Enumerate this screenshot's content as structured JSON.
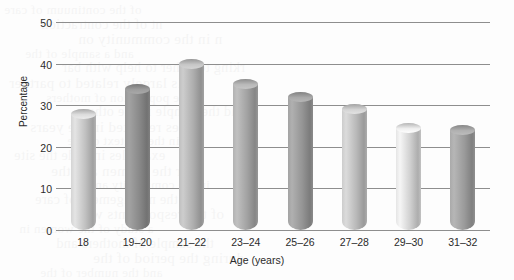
{
  "chart_data": {
    "type": "bar",
    "title": "",
    "subtitle": "",
    "xlabel": "Age (years)",
    "ylabel": "Percentage",
    "categories": [
      "18",
      "19–20",
      "21–22",
      "23–24",
      "25–26",
      "27–28",
      "29–30",
      "31–32"
    ],
    "values": [
      28,
      34,
      40,
      35,
      32,
      29,
      24.5,
      24
    ],
    "series": [
      {
        "name": "Percentage",
        "values": [
          28,
          34,
          40,
          35,
          32,
          29,
          24.5,
          24
        ]
      }
    ],
    "ylim": [
      0,
      50
    ],
    "yticks": [
      0,
      10,
      20,
      30,
      40,
      50
    ],
    "ytick_labels": [
      "0",
      "10",
      "20",
      "30",
      "40",
      "50"
    ],
    "grid": true,
    "grid_axis": "y",
    "legend": false,
    "legend_position": "none",
    "bar_style": "3d-cylinder",
    "bar_colors": [
      "#c8c8c8",
      "#8f8f8f",
      "#b4b4b4",
      "#a8a8a8",
      "#9a9a9a",
      "#c0c0c0",
      "#d8d8d8",
      "#a0a0a0"
    ],
    "annotations": []
  },
  "axes": {
    "y_axis_title": "Percentage",
    "x_axis_title": "Age (years)"
  },
  "colors": {
    "background": "#fdfdfd",
    "gridline": "#8e8e8e",
    "text": "#2b2b2b"
  },
  "bleed_text": [
    "of the continuum of care",
    "nt of the contraction",
    "n in the community on",
    "and a sample of the",
    "rking together to help with bar",
    "is largely related to partner",
    "in the population of mothers",
    "and the sample in the other",
    "cases reported in the years",
    "but in the context of the",
    "examples include the site",
    "for the women and the",
    "in the community and",
    "on the management of care",
    "of the respondents were",
    "a study of the women in",
    "the sample of mothers and",
    "during the period of the",
    "and the number of the"
  ]
}
